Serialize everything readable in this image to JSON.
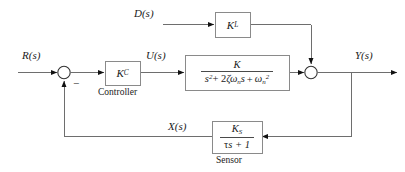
{
  "diagram": {
    "line_color": "#6e6e6e",
    "arrow_color": "#111111",
    "box_stroke": "#8a8a8a",
    "background": "#ffffff",
    "signals": {
      "reference": "R(s)",
      "disturbance": "D(s)",
      "control": "U(s)",
      "output": "Y(s)",
      "measurement": "X(s)"
    },
    "summing_junctions": [
      {
        "name": "error-junction",
        "sign_label": "−"
      },
      {
        "name": "disturbance-junction",
        "sign_label": ""
      }
    ],
    "blocks": {
      "controller": {
        "gain": "K",
        "gain_sub": "C",
        "caption": "Controller"
      },
      "load": {
        "gain": "K",
        "gain_sub": "L",
        "caption": ""
      },
      "plant": {
        "numerator": "K",
        "denominator_parts": {
          "s_sq": "s",
          "s_sq_exp": "2",
          "plus1": "+ 2",
          "zeta": "ζ",
          "omega": "ω",
          "omega_sub": "n",
          "s_term": "s",
          "plus2": "+",
          "omega2": "ω",
          "omega2_sub": "n",
          "omega2_exp": "2"
        },
        "denominator_plain": "s² + 2ζωₙs + ωₙ²",
        "caption": ""
      },
      "sensor": {
        "numerator": "K",
        "numerator_sub": "S",
        "denominator_tau": "τ",
        "denominator_rest": "s + 1",
        "caption": "Sensor"
      }
    }
  }
}
